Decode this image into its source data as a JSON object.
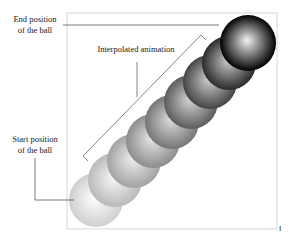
{
  "diagram": {
    "labels": {
      "end_line1": "End position",
      "end_line2": "of the ball",
      "start_line1": "Start position",
      "start_line2": "of the ball",
      "interpolated": "Interpolated animation"
    },
    "page_mark": "I",
    "frame": {
      "x": 67,
      "y": 13,
      "width": 210,
      "height": 216,
      "stroke": "#d6d6d6"
    },
    "balls": [
      {
        "cx": 96,
        "cy": 200,
        "r": 27,
        "light": "#ffffff",
        "dark": "#cfcfcf"
      },
      {
        "cx": 115,
        "cy": 180,
        "r": 27,
        "light": "#f8f8f8",
        "dark": "#b9b9b9"
      },
      {
        "cx": 134,
        "cy": 161,
        "r": 27,
        "light": "#eeeeee",
        "dark": "#a2a2a2"
      },
      {
        "cx": 153,
        "cy": 141,
        "r": 27,
        "light": "#e6e6e6",
        "dark": "#8c8c8c"
      },
      {
        "cx": 172,
        "cy": 122,
        "r": 27,
        "light": "#dddddd",
        "dark": "#757575"
      },
      {
        "cx": 191,
        "cy": 102,
        "r": 27,
        "light": "#d5d5d5",
        "dark": "#5c5c5c"
      },
      {
        "cx": 210,
        "cy": 82,
        "r": 27,
        "light": "#cfcfcf",
        "dark": "#444444"
      },
      {
        "cx": 229,
        "cy": 63,
        "r": 27,
        "light": "#cbcbcb",
        "dark": "#2a2a2a"
      },
      {
        "cx": 248,
        "cy": 43,
        "r": 28,
        "light": "#f2f2f2",
        "dark": "#000000"
      }
    ]
  }
}
